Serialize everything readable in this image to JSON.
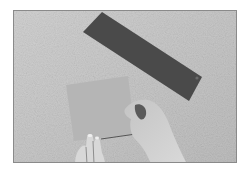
{
  "photo": {
    "description": "Grayscale photograph of hands holding a light square sheet of paper on a textured surface, with a dark rectangular strip of paper lying diagonally above",
    "colors": {
      "background_surface": "#c9c9c9",
      "surface_speckle": "#dcdcdc",
      "dark_strip": "#4a4a4a",
      "light_card": "#b8b8b8",
      "hand": "#d0d0d0",
      "border": "#8a8a8a"
    }
  }
}
